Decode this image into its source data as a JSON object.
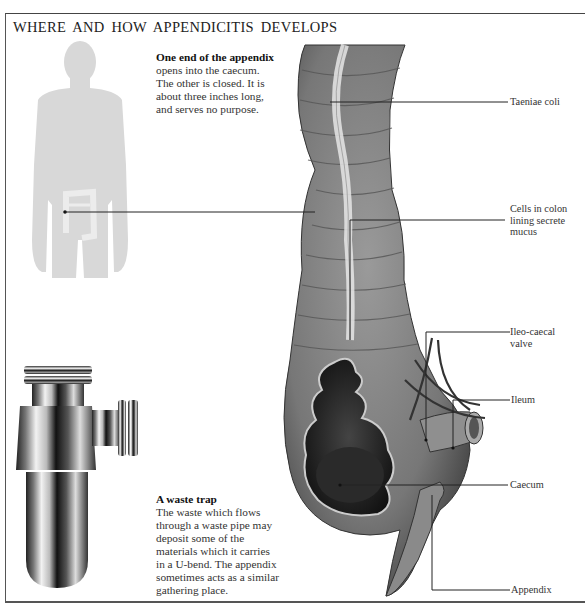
{
  "title": "WHERE AND HOW APPENDICITIS DEVELOPS",
  "intro": {
    "heading": "One end of the appendix",
    "lines": [
      "opens into the caecum.",
      "The other is closed. It is",
      "about three inches long,",
      "and serves no purpose."
    ]
  },
  "trap": {
    "heading": "A waste trap",
    "lines": [
      "The waste which flows",
      "through a waste pipe may",
      "deposit some of the",
      "materials which it carries",
      "in a U-bend. The appendix",
      "sometimes acts as a similar",
      "gathering place."
    ]
  },
  "labels": {
    "taeniae": "Taeniae coli",
    "cells": [
      "Cells in colon",
      "lining secrete",
      "mucus"
    ],
    "valve": [
      "Ileo-caecal",
      "valve"
    ],
    "ileum": "Ileum",
    "caecum": "Caecum",
    "appendix": "Appendix"
  },
  "colors": {
    "silhouette": "#d9d9d9",
    "colon": "#8a8a8a",
    "colon_dark": "#3a3a3a",
    "leader": "#222222"
  }
}
